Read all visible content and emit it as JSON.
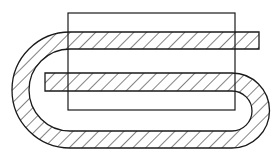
{
  "diagram": {
    "title": "Folded hatched strip over rectangle",
    "stroke_color": "#1a1a1a",
    "background": "#ffffff",
    "elements": {
      "rectangle": {
        "x": 68,
        "y": 13,
        "width": 167,
        "height": 97
      },
      "top_band": {
        "y_top": 32,
        "y_bottom": 49,
        "x_right": 259
      },
      "middle_band": {
        "y_top": 73,
        "y_bottom": 91,
        "x_left": 45
      },
      "bottom_band": {
        "y_top": 131,
        "y_bottom": 148
      },
      "left_bend": {
        "center_x": 70,
        "center_y": 90,
        "outer_radius": 58,
        "inner_radius": 41
      },
      "right_bend": {
        "center_x": 232,
        "center_y": 110.5,
        "outer_radius": 37.5,
        "inner_radius": 20
      }
    }
  }
}
